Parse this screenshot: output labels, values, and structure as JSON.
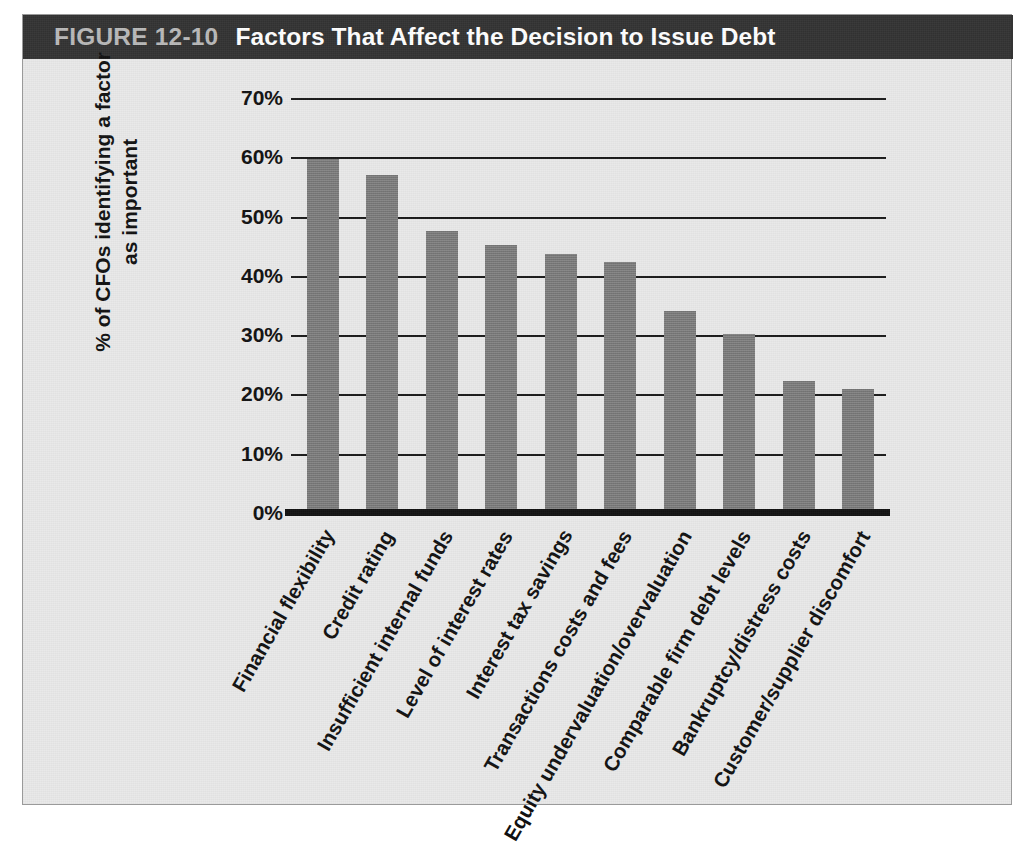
{
  "figure": {
    "number": "FIGURE 12-10",
    "title": "Factors That Affect the Decision to Issue Debt",
    "caption": ""
  },
  "colors": {
    "title_bar_bg": "#333333",
    "figure_number_text": "#b9b9b9",
    "title_text": "#ffffff",
    "panel_bg": "#e9e9e9",
    "bar_fill": "#7c7c7c",
    "axis_line": "#111111",
    "gridline": "#1b1b1b",
    "tick_text": "#111111"
  },
  "chart_data": {
    "type": "bar",
    "title": "Factors That Affect the Decision to Issue Debt",
    "xlabel": "",
    "ylabel": "% of CFOs identifying a factor as important",
    "ylabel_line1": "% of CFOs identifying a factor",
    "ylabel_line2": "as important",
    "ylim": [
      0,
      70
    ],
    "ytick_values": [
      70,
      60,
      50,
      40,
      30,
      20,
      10,
      0
    ],
    "ytick_labels": [
      "70%",
      "60%",
      "50%",
      "40%",
      "30%",
      "20%",
      "10%",
      "0%"
    ],
    "grid": true,
    "legend": null,
    "legend_position": "none",
    "categories": [
      "Financial flexibility",
      "Credit rating",
      "Insufficient internal funds",
      "Level of interest rates",
      "Interest tax savings",
      "Transactions costs and fees",
      "Equity undervaluation/overvaluation",
      "Comparable firm debt levels",
      "Bankruptcy/distress costs",
      "Customer/supplier discomfort"
    ],
    "values": [
      59.7,
      57.0,
      47.5,
      45.2,
      43.7,
      42.4,
      34.0,
      30.2,
      22.2,
      21.0
    ]
  }
}
